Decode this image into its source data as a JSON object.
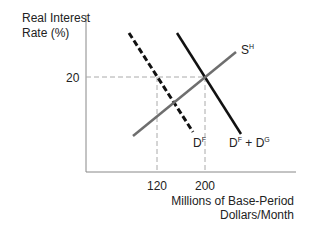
{
  "diagram": {
    "y_axis_label_line1": "Real Interest",
    "y_axis_label_line2": "Rate (%)",
    "y_tick": "20",
    "x_ticks": [
      "120",
      "200"
    ],
    "x_axis_label_line1": "Millions of Base-Period",
    "x_axis_label_line2": "Dollars/Month",
    "curves": {
      "supply": {
        "label": "S",
        "sup": "H",
        "color": "#6e6e6e"
      },
      "foreign_demand": {
        "label": "D",
        "sup": "F",
        "style": "dashed",
        "color": "#111111"
      },
      "total_demand": {
        "label_a": "D",
        "sup_a": "F",
        "plus": " + ",
        "label_b": "D",
        "sup_b": "G",
        "color": "#111111"
      }
    },
    "guide_color": "#aaaaaa"
  }
}
